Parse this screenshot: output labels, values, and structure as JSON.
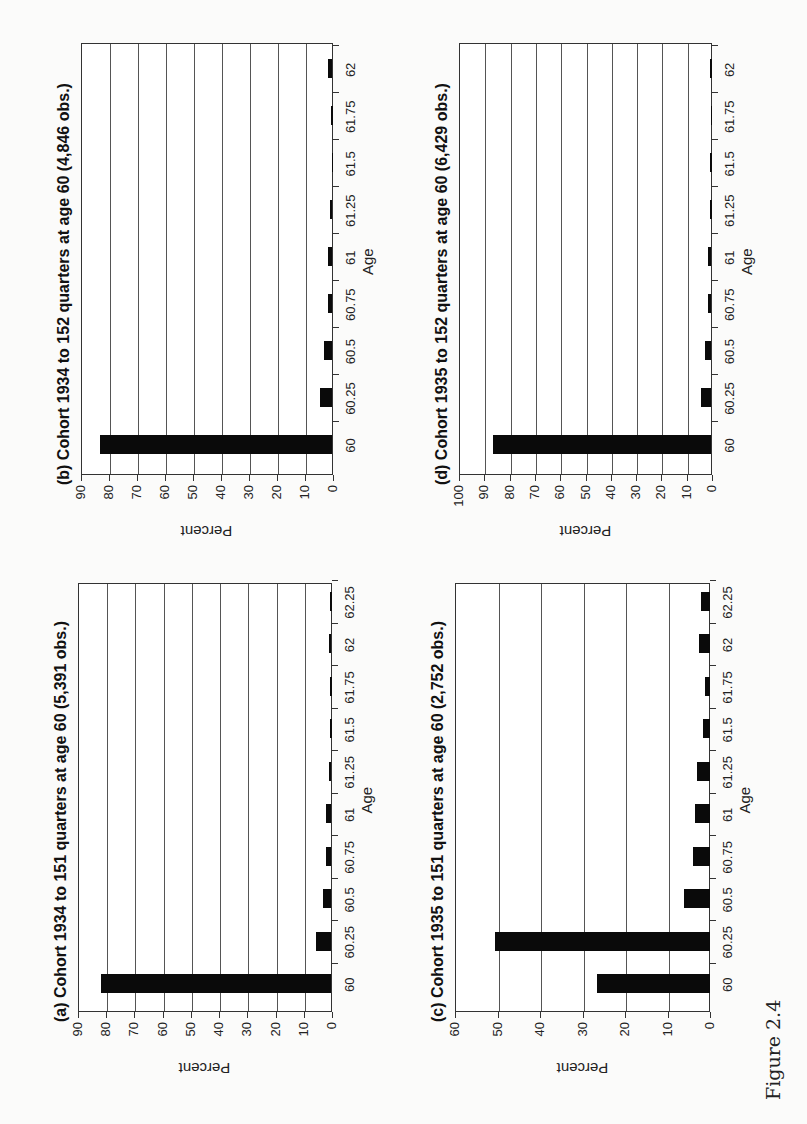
{
  "figure": {
    "label": "Figure 2.4"
  },
  "chart_data": [
    {
      "id": "a",
      "type": "bar",
      "title": "(a) Cohort 1934 to 151 quarters at age 60 (5,391 obs.)",
      "xlabel": "Age",
      "ylabel": "Percent",
      "categories": [
        "60",
        "60.25",
        "60.5",
        "60.75",
        "61",
        "61.25",
        "61.5",
        "61.75",
        "62",
        "62.25"
      ],
      "values": [
        81.5,
        5.5,
        3,
        2,
        2,
        1,
        0.5,
        0.5,
        1,
        0.5
      ],
      "ylim": [
        0,
        90
      ],
      "yticks": [
        0,
        10,
        20,
        30,
        40,
        50,
        60,
        70,
        80,
        90
      ],
      "grid": true
    },
    {
      "id": "b",
      "type": "bar",
      "title": "(b) Cohort 1934 to 152 quarters at age 60 (4,846 obs.)",
      "xlabel": "Age",
      "ylabel": "Percent",
      "categories": [
        "60",
        "60.25",
        "60.5",
        "60.75",
        "61",
        "61.25",
        "61.5",
        "61.75",
        "62"
      ],
      "values": [
        83,
        4.5,
        3,
        1.5,
        1.5,
        1,
        0.3,
        0.5,
        1.5
      ],
      "ylim": [
        0,
        90
      ],
      "yticks": [
        0,
        10,
        20,
        30,
        40,
        50,
        60,
        70,
        80,
        90
      ],
      "grid": true
    },
    {
      "id": "c",
      "type": "bar",
      "title": "(c) Cohort 1935 to 151 quarters at age 60 (2,752 obs.)",
      "xlabel": "Age",
      "ylabel": "Percent",
      "categories": [
        "60",
        "60.25",
        "60.5",
        "60.75",
        "61",
        "61.25",
        "61.5",
        "61.75",
        "62",
        "62.25"
      ],
      "values": [
        26.5,
        50.5,
        6,
        4,
        3.5,
        3,
        1.5,
        1,
        2.5,
        2
      ],
      "ylim": [
        0,
        60
      ],
      "yticks": [
        0,
        10,
        20,
        30,
        40,
        50,
        60
      ],
      "grid": true
    },
    {
      "id": "d",
      "type": "bar",
      "title": "(d) Cohort 1935 to 152 quarters at age 60 (6,429 obs.)",
      "xlabel": "Age",
      "ylabel": "Percent",
      "categories": [
        "60",
        "60.25",
        "60.5",
        "60.75",
        "61",
        "61.25",
        "61.5",
        "61.75",
        "62"
      ],
      "values": [
        86.5,
        4,
        2.5,
        1.5,
        1.5,
        0.5,
        0.5,
        0.3,
        0.5
      ],
      "ylim": [
        0,
        100
      ],
      "yticks": [
        0,
        10,
        20,
        30,
        40,
        50,
        60,
        70,
        80,
        90,
        100
      ],
      "grid": true
    }
  ],
  "layout": {
    "panels": {
      "a": {
        "left": 112,
        "top": 78,
        "width": 429,
        "height": 254,
        "titleTop": 56
      },
      "b": {
        "left": 649,
        "top": 81,
        "width": 432,
        "height": 252,
        "titleTop": 56
      },
      "c": {
        "left": 112,
        "top": 455,
        "width": 429,
        "height": 255,
        "titleTop": 433
      },
      "d": {
        "left": 649,
        "top": 459,
        "width": 432,
        "height": 253,
        "titleTop": 436
      }
    },
    "bar_color": "#0a0a0a",
    "grid_color": "#555555"
  }
}
